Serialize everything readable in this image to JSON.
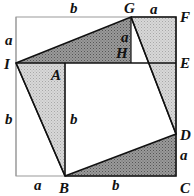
{
  "diagram": {
    "points": {
      "I": "I",
      "G": "G",
      "F": "F",
      "E": "E",
      "A": "A",
      "H": "H",
      "D": "D",
      "C": "C",
      "B": "B"
    },
    "side_labels": {
      "top_b": "b",
      "top_a": "a",
      "left_a": "a",
      "left_b": "b",
      "inner_b": "b",
      "inner_a": "a",
      "right_a": "a",
      "bottom_a": "a",
      "bottom_b": "b"
    },
    "colors": {
      "dark_fill": "#8a8a8a",
      "light_fill": "#cfcfcf",
      "stroke": "#111111"
    }
  }
}
